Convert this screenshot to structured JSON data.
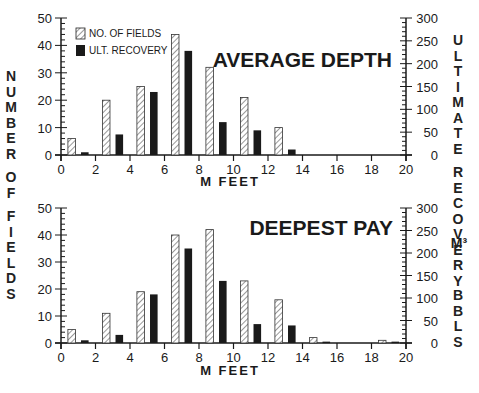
{
  "figure": {
    "left_axis_label": "NUMBER OF FIELDS",
    "right_axis_label_main": "ULTIMATE RECOVERY",
    "right_axis_unit_metric": "M³",
    "right_axis_unit_imperial": "BBLS",
    "x_axis_label": "M FEET",
    "legend": {
      "fields_label": "NO. OF FIELDS",
      "recovery_label": "ULT. RECOVERY"
    },
    "colors": {
      "ink": "#1a1a1a",
      "hatch_bg": "#ffffff"
    }
  },
  "chart_data": [
    {
      "type": "bar",
      "title": "AVERAGE DEPTH",
      "xlabel": "M FEET",
      "ylabel": "NUMBER OF FIELDS",
      "y2label": "ULTIMATE RECOVERY M³ BBLS",
      "xlim": [
        0,
        20
      ],
      "ylim": [
        0,
        50
      ],
      "y2lim": [
        0,
        300
      ],
      "x_ticks": [
        0,
        2,
        4,
        6,
        8,
        10,
        12,
        14,
        16,
        18,
        20
      ],
      "y_ticks": [
        0,
        10,
        20,
        30,
        40,
        50
      ],
      "y2_ticks": [
        0,
        50,
        100,
        150,
        200,
        250,
        300
      ],
      "categories": [
        "0-2",
        "2-4",
        "4-6",
        "6-8",
        "8-10",
        "10-12",
        "12-14",
        "14-16",
        "16-18",
        "18-20"
      ],
      "bin_starts": [
        0,
        2,
        4,
        6,
        8,
        10,
        12,
        14,
        16,
        18
      ],
      "series": [
        {
          "name": "NO. OF FIELDS",
          "axis": "left",
          "style": "hatched",
          "values": [
            6,
            20,
            25,
            44,
            32,
            21,
            10,
            0,
            0,
            0
          ]
        },
        {
          "name": "ULT. RECOVERY",
          "axis": "right",
          "style": "solid",
          "values": [
            6,
            45,
            138,
            228,
            72,
            54,
            12,
            0,
            0,
            0
          ]
        }
      ],
      "legend_position": "upper left",
      "grid": false
    },
    {
      "type": "bar",
      "title": "DEEPEST PAY",
      "xlabel": "M FEET",
      "ylabel": "NUMBER OF FIELDS",
      "y2label": "ULTIMATE RECOVERY M³ BBLS",
      "xlim": [
        0,
        20
      ],
      "ylim": [
        0,
        50
      ],
      "y2lim": [
        0,
        300
      ],
      "x_ticks": [
        0,
        2,
        4,
        6,
        8,
        10,
        12,
        14,
        16,
        18,
        20
      ],
      "y_ticks": [
        0,
        10,
        20,
        30,
        40,
        50
      ],
      "y2_ticks": [
        0,
        50,
        100,
        150,
        200,
        250,
        300
      ],
      "categories": [
        "0-2",
        "2-4",
        "4-6",
        "6-8",
        "8-10",
        "10-12",
        "12-14",
        "14-16",
        "16-18",
        "18-20"
      ],
      "bin_starts": [
        0,
        2,
        4,
        6,
        8,
        10,
        12,
        14,
        16,
        18
      ],
      "series": [
        {
          "name": "NO. OF FIELDS",
          "axis": "left",
          "style": "hatched",
          "values": [
            5,
            11,
            19,
            40,
            42,
            23,
            16,
            2,
            0,
            1
          ]
        },
        {
          "name": "ULT. RECOVERY",
          "axis": "right",
          "style": "solid",
          "values": [
            6,
            18,
            108,
            210,
            138,
            42,
            39,
            3,
            0,
            3
          ]
        }
      ],
      "grid": false
    }
  ]
}
